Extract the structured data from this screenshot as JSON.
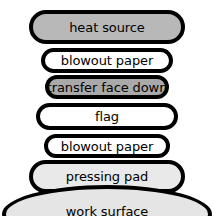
{
  "diagram": {
    "background_color": "#ffffff",
    "outline_color": "#000000",
    "layers": [
      {
        "id": "heat-source",
        "label": "heat source",
        "fill": "#b8b8b8",
        "shape": "rounded-rectangle"
      },
      {
        "id": "blowout-paper-top",
        "label": "blowout paper",
        "fill": "#ffffff",
        "shape": "rounded-rectangle"
      },
      {
        "id": "transfer-face-down",
        "label": "transfer face down",
        "fill": "#a9a9a9",
        "shape": "rounded-rectangle"
      },
      {
        "id": "flag",
        "label": "flag",
        "fill": "#ffffff",
        "shape": "rounded-rectangle"
      },
      {
        "id": "blowout-paper-bottom",
        "label": "blowout paper",
        "fill": "#ffffff",
        "shape": "rounded-rectangle"
      },
      {
        "id": "pressing-pad",
        "label": "pressing pad",
        "fill": "#e9e9e9",
        "shape": "rounded-rectangle"
      },
      {
        "id": "work-surface",
        "label": "work surface",
        "fill": "#e5e5e5",
        "shape": "ellipse"
      }
    ]
  }
}
